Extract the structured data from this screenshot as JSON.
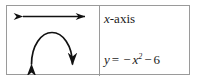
{
  "figure": {
    "kind": "math-figure-two-cell-table",
    "border_color": "#9a9a9a",
    "ink_color": "#111111",
    "background": "#ffffff",
    "left_cell": {
      "name": "graph-sketch",
      "elements": [
        {
          "type": "double-headed-arrow",
          "orientation": "horizontal",
          "meaning": "x-axis",
          "x_start": 18,
          "x_end": 85,
          "y": 16
        },
        {
          "type": "parabola",
          "opening": "down",
          "meaning": "y = -x^2 - 6",
          "vertex_x": 52,
          "vertex_y": 32,
          "left_end_x": 30,
          "right_end_x": 74,
          "end_y": 68,
          "arrowheads": "both-ends-pointing-down-outward"
        }
      ]
    },
    "right_cell": {
      "name": "legend-labels",
      "axis_label_prefix": "x",
      "axis_label_suffix": "-axis",
      "axis_label_full": "x-axis",
      "equation_lhs": "y",
      "equation_eq": "=",
      "equation_neg1": "−",
      "equation_base": "x",
      "equation_exponent": "2",
      "equation_neg2": "−",
      "equation_constant": "6",
      "equation_full": "y = −x² − 6"
    }
  }
}
